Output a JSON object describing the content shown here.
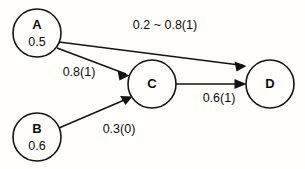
{
  "diagram": {
    "type": "directed-graph",
    "background_color": "#fffefb",
    "stroke_color": "#131313",
    "text_color": "#0d0d0d",
    "nodes": [
      {
        "id": "A",
        "label": "A",
        "value": "0.5",
        "cx": 37,
        "cy": 33,
        "r": 24
      },
      {
        "id": "B",
        "label": "B",
        "value": "0.6",
        "cx": 37,
        "cy": 137,
        "r": 24
      },
      {
        "id": "C",
        "label": "C",
        "value": "",
        "cx": 152,
        "cy": 84,
        "r": 24
      },
      {
        "id": "D",
        "label": "D",
        "value": "",
        "cx": 270,
        "cy": 84,
        "r": 24
      }
    ],
    "edges": [
      {
        "id": "A-D",
        "from": "A",
        "to": "D",
        "label": "0.2 ~ 0.8(1)",
        "label_x": 165,
        "label_y": 26
      },
      {
        "id": "A-C",
        "from": "A",
        "to": "C",
        "label": "0.8(1)",
        "label_x": 79,
        "label_y": 73
      },
      {
        "id": "B-C",
        "from": "B",
        "to": "C",
        "label": "0.3(0)",
        "label_x": 119,
        "label_y": 130
      },
      {
        "id": "C-D",
        "from": "C",
        "to": "D",
        "label": "0.6(1)",
        "label_x": 219,
        "label_y": 99
      }
    ]
  }
}
